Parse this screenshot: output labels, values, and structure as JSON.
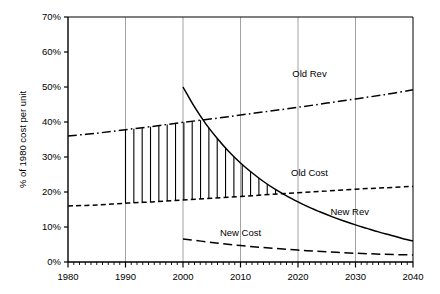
{
  "chart_data": {
    "type": "line",
    "title": "",
    "xlabel": "",
    "ylabel": "% of 1980 cost per unit",
    "xlim": [
      1980,
      2040
    ],
    "ylim": [
      0,
      70
    ],
    "grid": "vertical gridlines at each decade",
    "legend_position": "inline labels next to curves",
    "y_ticks": [
      "0%",
      "10%",
      "20%",
      "30%",
      "40%",
      "50%",
      "60%",
      "70%"
    ],
    "y_tick_values": [
      0,
      10,
      20,
      30,
      40,
      50,
      60,
      70
    ],
    "x_ticks": [
      "1980",
      "1990",
      "2000",
      "2010",
      "2020",
      "2030",
      "2040"
    ],
    "x_tick_values": [
      1980,
      1990,
      2000,
      2010,
      2020,
      2030,
      2040
    ],
    "x_minor_tick_interval": 1,
    "shaded_region": {
      "label": "hatch between Old Rev and Old Cost",
      "style": "vertical-line hatch",
      "x_start": 1990,
      "x_end": 2019
    },
    "series": [
      {
        "name": "Old Rev",
        "label": "Old Rev",
        "style": "dash-dot",
        "label_x": 2022,
        "label_y": 53,
        "x": [
          1980,
          1985,
          1990,
          1995,
          2000,
          2005,
          2010,
          2015,
          2020,
          2025,
          2030,
          2035,
          2040
        ],
        "values": [
          36.0,
          36.8,
          37.8,
          38.8,
          39.9,
          40.9,
          42.0,
          43.1,
          44.2,
          45.4,
          46.6,
          47.8,
          49.2
        ]
      },
      {
        "name": "Old Cost",
        "label": "Old Cost",
        "style": "short-dash",
        "label_x": 2022,
        "label_y": 24.5,
        "x": [
          1980,
          1985,
          1990,
          1995,
          2000,
          2005,
          2010,
          2015,
          2020,
          2025,
          2030,
          2035,
          2040
        ],
        "values": [
          16.0,
          16.3,
          16.8,
          17.2,
          17.7,
          18.2,
          18.7,
          19.3,
          19.8,
          20.3,
          20.8,
          21.2,
          21.6
        ]
      },
      {
        "name": "New Rev",
        "label": "New Rev",
        "style": "solid",
        "label_x": 2029,
        "label_y": 13.5,
        "x": [
          2000,
          2002,
          2004,
          2006,
          2008,
          2010,
          2012,
          2014,
          2016,
          2018,
          2020,
          2022,
          2024,
          2026,
          2028,
          2030,
          2032,
          2034,
          2036,
          2038,
          2040
        ],
        "values": [
          50.0,
          44.3,
          39.4,
          35.2,
          31.5,
          28.3,
          25.5,
          23.0,
          20.8,
          18.9,
          17.2,
          15.6,
          14.2,
          12.9,
          11.7,
          10.6,
          9.6,
          8.6,
          7.7,
          6.8,
          6.0
        ]
      },
      {
        "name": "New Cost",
        "label": "New Cost",
        "style": "long-dash",
        "label_x": 2010,
        "label_y": 7.5,
        "x": [
          2000,
          2005,
          2010,
          2015,
          2020,
          2025,
          2030,
          2035,
          2040
        ],
        "values": [
          6.6,
          5.6,
          4.7,
          4.0,
          3.4,
          2.9,
          2.5,
          2.2,
          2.0
        ]
      }
    ]
  }
}
